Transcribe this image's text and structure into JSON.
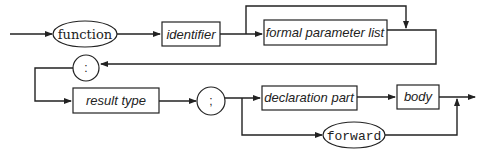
{
  "diagram": {
    "nodes": {
      "function": {
        "label": "function",
        "kind": "terminal"
      },
      "identifier": {
        "label": "identifier",
        "kind": "nonterminal"
      },
      "formal_parameter_list": {
        "label": "formal parameter list",
        "kind": "nonterminal"
      },
      "colon": {
        "label": ":",
        "kind": "terminal"
      },
      "result_type": {
        "label": "result type",
        "kind": "nonterminal"
      },
      "semicolon": {
        "label": ";",
        "kind": "terminal"
      },
      "declaration_part": {
        "label": "declaration part",
        "kind": "nonterminal"
      },
      "body": {
        "label": "body",
        "kind": "nonterminal"
      },
      "forward": {
        "label": "forward",
        "kind": "terminal"
      }
    },
    "edges": [
      [
        "start",
        "function"
      ],
      [
        "function",
        "identifier"
      ],
      [
        "identifier",
        "formal_parameter_list"
      ],
      [
        "identifier",
        "colon"
      ],
      [
        "formal_parameter_list",
        "colon"
      ],
      [
        "colon",
        "result_type"
      ],
      [
        "result_type",
        "semicolon"
      ],
      [
        "semicolon",
        "declaration_part"
      ],
      [
        "semicolon",
        "forward"
      ],
      [
        "declaration_part",
        "body"
      ],
      [
        "body",
        "end"
      ],
      [
        "forward",
        "end"
      ]
    ]
  }
}
